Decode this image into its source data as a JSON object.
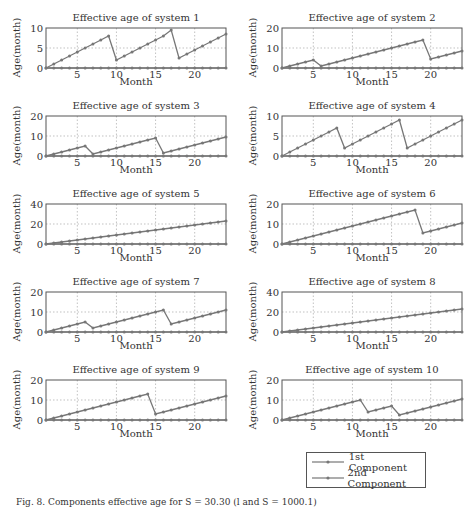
{
  "figure": {
    "caption": "Fig. 8. Components effective age for S = 30.30 (l and S = 1000.1)",
    "line_color": "#777777"
  },
  "legend": {
    "items": [
      {
        "label": "1st Component"
      },
      {
        "label": "2nd Component"
      }
    ]
  },
  "chart_data": [
    {
      "type": "line",
      "title": "Effective age of system 1",
      "xlabel": "Month",
      "ylabel": "Age(month)",
      "xlim": [
        1,
        24
      ],
      "ylim": [
        0,
        10
      ],
      "yticks": [
        0,
        5,
        10
      ],
      "xticks": [
        5,
        10,
        15,
        20
      ],
      "grid": true,
      "x": [
        1,
        2,
        3,
        4,
        5,
        6,
        7,
        8,
        9,
        10,
        11,
        12,
        13,
        14,
        15,
        16,
        17,
        18,
        19,
        20,
        21,
        22,
        23,
        24
      ],
      "series": [
        {
          "name": "1st Component",
          "values": [
            0,
            1,
            2,
            3,
            4,
            5,
            6,
            7,
            8,
            2,
            3,
            4,
            5,
            6,
            7,
            8,
            9.5,
            2.5,
            3.5,
            4.5,
            5.5,
            6.5,
            7.5,
            8.5
          ]
        },
        {
          "name": "2nd Component",
          "values": [
            0,
            0,
            0,
            0,
            0,
            0,
            0,
            0,
            0,
            0,
            0,
            0,
            0,
            0,
            0,
            0,
            0,
            0,
            0,
            0,
            0,
            0,
            0,
            0
          ]
        }
      ]
    },
    {
      "type": "line",
      "title": "Effective age of system 2",
      "xlabel": "Month",
      "ylabel": "Age(month)",
      "xlim": [
        1,
        24
      ],
      "ylim": [
        0,
        20
      ],
      "yticks": [
        0,
        10,
        20
      ],
      "xticks": [
        5,
        10,
        15,
        20
      ],
      "grid": true,
      "x": [
        1,
        2,
        3,
        4,
        5,
        6,
        7,
        8,
        9,
        10,
        11,
        12,
        13,
        14,
        15,
        16,
        17,
        18,
        19,
        20,
        21,
        22,
        23,
        24
      ],
      "series": [
        {
          "name": "1st Component",
          "values": [
            0,
            1,
            2,
            3,
            4,
            1,
            2,
            3,
            4,
            5,
            6,
            7,
            8,
            9,
            10,
            11,
            12,
            13,
            14,
            4.5,
            5.5,
            6.5,
            7.5,
            8.5
          ]
        },
        {
          "name": "2nd Component",
          "values": [
            0,
            0,
            0,
            0,
            0,
            0,
            0,
            0,
            0,
            0,
            0,
            0,
            0,
            0,
            0,
            0,
            0,
            0,
            0,
            0,
            0,
            0,
            0,
            0
          ]
        }
      ]
    },
    {
      "type": "line",
      "title": "Effective age of system 3",
      "xlabel": "Month",
      "ylabel": "Age(month)",
      "xlim": [
        1,
        24
      ],
      "ylim": [
        0,
        20
      ],
      "yticks": [
        0,
        10,
        20
      ],
      "xticks": [
        5,
        10,
        15,
        20
      ],
      "grid": true,
      "x": [
        1,
        2,
        3,
        4,
        5,
        6,
        7,
        8,
        9,
        10,
        11,
        12,
        13,
        14,
        15,
        16,
        17,
        18,
        19,
        20,
        21,
        22,
        23,
        24
      ],
      "series": [
        {
          "name": "1st Component",
          "values": [
            0,
            1,
            2,
            3,
            4,
            5,
            1,
            2,
            3,
            4,
            5,
            6,
            7,
            8,
            9,
            1.5,
            2.5,
            3.5,
            4.5,
            5.5,
            6.5,
            7.5,
            8.5,
            9.5
          ]
        },
        {
          "name": "2nd Component",
          "values": [
            0,
            0,
            0,
            0,
            0,
            0,
            0,
            0,
            0,
            0,
            0,
            0,
            0,
            0,
            0,
            0,
            0,
            0,
            0,
            0,
            0,
            0,
            0,
            0
          ]
        }
      ]
    },
    {
      "type": "line",
      "title": "Effective age of system 4",
      "xlabel": "Month",
      "ylabel": "Age(month)",
      "xlim": [
        1,
        24
      ],
      "ylim": [
        0,
        10
      ],
      "yticks": [
        0,
        5,
        10
      ],
      "xticks": [
        5,
        10,
        15,
        20
      ],
      "grid": true,
      "x": [
        1,
        2,
        3,
        4,
        5,
        6,
        7,
        8,
        9,
        10,
        11,
        12,
        13,
        14,
        15,
        16,
        17,
        18,
        19,
        20,
        21,
        22,
        23,
        24
      ],
      "series": [
        {
          "name": "1st Component",
          "values": [
            0,
            1,
            2,
            3,
            4,
            5,
            6,
            7,
            2,
            3,
            4,
            5,
            6,
            7,
            8,
            9,
            2,
            3,
            4,
            5,
            6,
            7,
            8,
            9
          ]
        },
        {
          "name": "2nd Component",
          "values": [
            0,
            0,
            0,
            0,
            0,
            0,
            0,
            0,
            0,
            0,
            0,
            0,
            0,
            0,
            0,
            0,
            0,
            0,
            0,
            0,
            0,
            0,
            0,
            0
          ]
        }
      ]
    },
    {
      "type": "line",
      "title": "Effective age of system 5",
      "xlabel": "Month",
      "ylabel": "Age(month)",
      "xlim": [
        1,
        24
      ],
      "ylim": [
        0,
        40
      ],
      "yticks": [
        0,
        20,
        40
      ],
      "xticks": [
        5,
        10,
        15,
        20
      ],
      "grid": true,
      "x": [
        1,
        2,
        3,
        4,
        5,
        6,
        7,
        8,
        9,
        10,
        11,
        12,
        13,
        14,
        15,
        16,
        17,
        18,
        19,
        20,
        21,
        22,
        23,
        24
      ],
      "series": [
        {
          "name": "1st Component",
          "values": [
            0,
            1,
            2,
            3,
            4,
            5,
            6,
            7,
            8,
            9,
            10,
            11,
            12,
            13,
            14,
            15,
            16,
            17,
            18,
            19,
            20,
            21,
            22,
            23
          ]
        },
        {
          "name": "2nd Component",
          "values": [
            0,
            0,
            0,
            0,
            0,
            0,
            0,
            0,
            0,
            0,
            0,
            0,
            0,
            0,
            0,
            0,
            0,
            0,
            0,
            0,
            0,
            0,
            0,
            0
          ]
        }
      ]
    },
    {
      "type": "line",
      "title": "Effective age of system 6",
      "xlabel": "Month",
      "ylabel": "Age(month)",
      "xlim": [
        1,
        24
      ],
      "ylim": [
        0,
        20
      ],
      "yticks": [
        0,
        10,
        20
      ],
      "xticks": [
        5,
        10,
        15,
        20
      ],
      "grid": true,
      "x": [
        1,
        2,
        3,
        4,
        5,
        6,
        7,
        8,
        9,
        10,
        11,
        12,
        13,
        14,
        15,
        16,
        17,
        18,
        19,
        20,
        21,
        22,
        23,
        24
      ],
      "series": [
        {
          "name": "1st Component",
          "values": [
            0,
            1,
            2,
            3,
            4,
            5,
            6,
            7,
            8,
            9,
            10,
            11,
            12,
            13,
            14,
            15,
            16,
            17,
            5.5,
            6.5,
            7.5,
            8.5,
            9.5,
            10.5
          ]
        },
        {
          "name": "2nd Component",
          "values": [
            0,
            0,
            0,
            0,
            0,
            0,
            0,
            0,
            0,
            0,
            0,
            0,
            0,
            0,
            0,
            0,
            0,
            0,
            0,
            0,
            0,
            0,
            0,
            0
          ]
        }
      ]
    },
    {
      "type": "line",
      "title": "Effective age of system 7",
      "xlabel": "Month",
      "ylabel": "Age(month)",
      "xlim": [
        1,
        24
      ],
      "ylim": [
        0,
        20
      ],
      "yticks": [
        0,
        10,
        20
      ],
      "xticks": [
        5,
        10,
        15,
        20
      ],
      "grid": true,
      "x": [
        1,
        2,
        3,
        4,
        5,
        6,
        7,
        8,
        9,
        10,
        11,
        12,
        13,
        14,
        15,
        16,
        17,
        18,
        19,
        20,
        21,
        22,
        23,
        24
      ],
      "series": [
        {
          "name": "1st Component",
          "values": [
            0,
            1,
            2,
            3,
            4,
            5,
            2,
            3,
            4,
            5,
            6,
            7,
            8,
            9,
            10,
            11,
            4,
            5,
            6,
            7,
            8,
            9,
            10,
            11
          ]
        },
        {
          "name": "2nd Component",
          "values": [
            0,
            0,
            0,
            0,
            0,
            0,
            0,
            0,
            0,
            0,
            0,
            0,
            0,
            0,
            0,
            0,
            0,
            0,
            0,
            0,
            0,
            0,
            0,
            0
          ]
        }
      ]
    },
    {
      "type": "line",
      "title": "Effective age of system 8",
      "xlabel": "Month",
      "ylabel": "Age(month)",
      "xlim": [
        1,
        24
      ],
      "ylim": [
        0,
        40
      ],
      "yticks": [
        0,
        20,
        40
      ],
      "xticks": [
        5,
        10,
        15,
        20
      ],
      "grid": true,
      "x": [
        1,
        2,
        3,
        4,
        5,
        6,
        7,
        8,
        9,
        10,
        11,
        12,
        13,
        14,
        15,
        16,
        17,
        18,
        19,
        20,
        21,
        22,
        23,
        24
      ],
      "series": [
        {
          "name": "1st Component",
          "values": [
            0,
            1,
            2,
            3,
            4,
            5,
            6,
            7,
            8,
            9,
            10,
            11,
            12,
            13,
            14,
            15,
            16,
            17,
            18,
            19,
            20,
            21,
            22,
            23
          ]
        },
        {
          "name": "2nd Component",
          "values": [
            0,
            0,
            0,
            0,
            0,
            0,
            0,
            0,
            0,
            0,
            0,
            0,
            0,
            0,
            0,
            0,
            0,
            0,
            0,
            0,
            0,
            0,
            0,
            0
          ]
        }
      ]
    },
    {
      "type": "line",
      "title": "Effective age of system 9",
      "xlabel": "Month",
      "ylabel": "Age(month)",
      "xlim": [
        1,
        24
      ],
      "ylim": [
        0,
        20
      ],
      "yticks": [
        0,
        10,
        20
      ],
      "xticks": [
        5,
        10,
        15,
        20
      ],
      "grid": true,
      "x": [
        1,
        2,
        3,
        4,
        5,
        6,
        7,
        8,
        9,
        10,
        11,
        12,
        13,
        14,
        15,
        16,
        17,
        18,
        19,
        20,
        21,
        22,
        23,
        24
      ],
      "series": [
        {
          "name": "1st Component",
          "values": [
            0,
            1,
            2,
            3,
            4,
            5,
            6,
            7,
            8,
            9,
            10,
            11,
            12,
            13,
            3,
            4,
            5,
            6,
            7,
            8,
            9,
            10,
            11,
            12
          ]
        },
        {
          "name": "2nd Component",
          "values": [
            0,
            0,
            0,
            0,
            0,
            0,
            0,
            0,
            0,
            0,
            0,
            0,
            0,
            0,
            0,
            0,
            0,
            0,
            0,
            0,
            0,
            0,
            0,
            0
          ]
        }
      ]
    },
    {
      "type": "line",
      "title": "Effective age of system 10",
      "xlabel": "Month",
      "ylabel": "Age(month)",
      "xlim": [
        1,
        24
      ],
      "ylim": [
        0,
        20
      ],
      "yticks": [
        0,
        10,
        20
      ],
      "xticks": [
        5,
        10,
        15,
        20
      ],
      "grid": true,
      "x": [
        1,
        2,
        3,
        4,
        5,
        6,
        7,
        8,
        9,
        10,
        11,
        12,
        13,
        14,
        15,
        16,
        17,
        18,
        19,
        20,
        21,
        22,
        23,
        24
      ],
      "series": [
        {
          "name": "1st Component",
          "values": [
            0,
            1,
            2,
            3,
            4,
            5,
            6,
            7,
            8,
            9,
            10,
            4,
            5,
            6,
            7,
            2.5,
            3.5,
            4.5,
            5.5,
            6.5,
            7.5,
            8.5,
            9.5,
            10.5
          ]
        },
        {
          "name": "2nd Component",
          "values": [
            0,
            0,
            0,
            0,
            0,
            0,
            0,
            0,
            0,
            0,
            0,
            0,
            0,
            0,
            0,
            0,
            0,
            0,
            0,
            0,
            0,
            0,
            0,
            0
          ]
        }
      ]
    }
  ]
}
